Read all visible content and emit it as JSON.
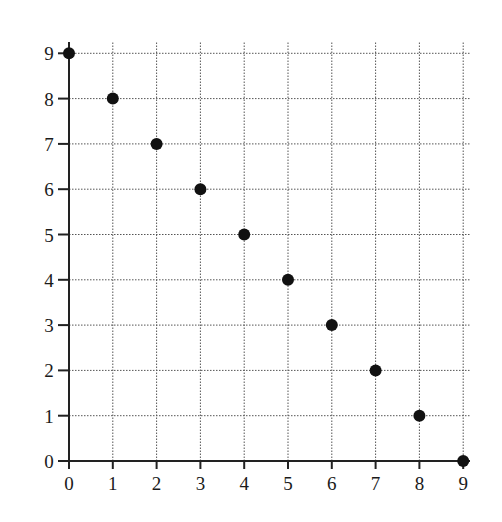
{
  "chart_data": {
    "type": "scatter",
    "title": "",
    "xlabel": "",
    "ylabel": "",
    "x": [
      0,
      1,
      2,
      3,
      4,
      5,
      6,
      7,
      8,
      9
    ],
    "y": [
      9,
      8,
      7,
      6,
      5,
      4,
      3,
      2,
      1,
      0
    ],
    "series": [
      {
        "name": "points",
        "points": [
          [
            0,
            9
          ],
          [
            1,
            8
          ],
          [
            2,
            7
          ],
          [
            3,
            6
          ],
          [
            4,
            5
          ],
          [
            5,
            4
          ],
          [
            6,
            3
          ],
          [
            7,
            2
          ],
          [
            8,
            1
          ],
          [
            9,
            0
          ]
        ]
      }
    ],
    "xlim": [
      0,
      9
    ],
    "ylim": [
      0,
      9
    ],
    "xticks": [
      "0",
      "1",
      "2",
      "3",
      "4",
      "5",
      "6",
      "7",
      "8",
      "9"
    ],
    "yticks": [
      "0",
      "1",
      "2",
      "3",
      "4",
      "5",
      "6",
      "7",
      "8",
      "9"
    ],
    "grid": true,
    "grid_style": "dotted",
    "legend": null,
    "colors": {
      "point": "#111111",
      "grid": "#555555",
      "axis": "#222222"
    }
  }
}
